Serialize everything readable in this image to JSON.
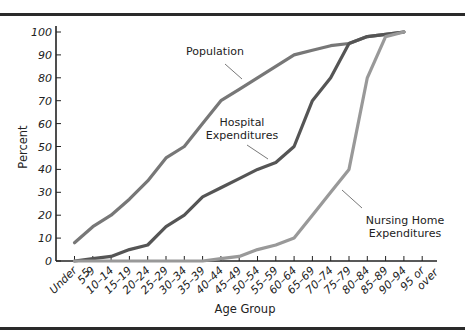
{
  "chart_data": {
    "type": "line",
    "title": "",
    "xlabel": "Age Group",
    "ylabel": "Percent",
    "ylim": [
      0,
      100
    ],
    "yticks": [
      0,
      10,
      20,
      30,
      40,
      50,
      60,
      70,
      80,
      90,
      100
    ],
    "grid": false,
    "legend": "inline annotations",
    "categories": [
      "Under 5",
      "5–9",
      "10–14",
      "15–19",
      "20–24",
      "25–29",
      "30–34",
      "35–39",
      "40–44",
      "45–49",
      "50–54",
      "55–59",
      "60–64",
      "65–69",
      "70–74",
      "75–79",
      "80–84",
      "85–89",
      "90–94",
      "95 or over"
    ],
    "series": [
      {
        "name": "Population",
        "color": "#777777",
        "values": [
          8,
          15,
          20,
          27,
          35,
          45,
          50,
          60,
          70,
          75,
          80,
          85,
          90,
          92,
          94,
          95,
          98,
          99,
          100,
          null
        ]
      },
      {
        "name": "Hospital Expenditures",
        "color": "#555555",
        "values": [
          0,
          1,
          2,
          5,
          7,
          15,
          20,
          28,
          32,
          36,
          40,
          43,
          50,
          70,
          80,
          95,
          98,
          99,
          100,
          null
        ]
      },
      {
        "name": "Nursing Home Expenditures",
        "color": "#999999",
        "values": [
          0,
          0,
          0,
          0,
          0,
          0,
          0,
          0,
          1,
          2,
          5,
          7,
          10,
          20,
          30,
          40,
          80,
          98,
          100,
          null
        ]
      }
    ],
    "annotations": [
      {
        "text": [
          "Population"
        ],
        "series": "Population"
      },
      {
        "text": [
          "Hospital",
          "Expenditures"
        ],
        "series": "Hospital Expenditures"
      },
      {
        "text": [
          "Nursing Home",
          "Expenditures"
        ],
        "series": "Nursing Home Expenditures"
      }
    ]
  }
}
